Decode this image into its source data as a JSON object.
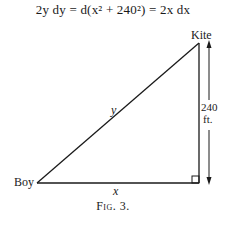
{
  "equation": {
    "lhs": "2y dy",
    "middle": "d(x² + 240²)",
    "rhs": "2x dx",
    "full": "2y dy = d(x² + 240²) = 2x dx"
  },
  "figure": {
    "labels": {
      "kite": "Kite",
      "boy": "Boy",
      "hypotenuse": "y",
      "base": "x",
      "height_value": "240",
      "height_unit": "ft."
    },
    "caption": "Fig. 3."
  }
}
